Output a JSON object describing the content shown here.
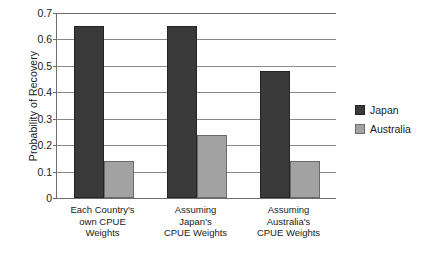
{
  "chart_data": {
    "type": "bar",
    "title": "",
    "subtitle": "",
    "xlabel": "",
    "ylabel": "Probability of Recovery",
    "ylim": [
      0,
      0.7
    ],
    "yticks": [
      "0",
      "0.1",
      "0.2",
      "0.3",
      "0.4",
      "0.5",
      "0.6",
      "0.7"
    ],
    "ytick_values": [
      0,
      0.1,
      0.2,
      0.3,
      0.4,
      0.5,
      0.6,
      0.7
    ],
    "grid": true,
    "grid_axis": "y",
    "legend_position": "right",
    "categories": [
      "Each Country's\nown CPUE\nWeights",
      "Assuming\nJapan's\nCPUE Weights",
      "Assuming\nAustralia's\nCPUE Weights"
    ],
    "series": [
      {
        "name": "Japan",
        "color": "#3a3a3a",
        "values": [
          0.65,
          0.65,
          0.48
        ]
      },
      {
        "name": "Australia",
        "color": "#a2a2a2",
        "values": [
          0.14,
          0.24,
          0.14
        ]
      }
    ]
  },
  "legend": {
    "items": [
      {
        "label": "Japan",
        "swatch": "#3a3a3a"
      },
      {
        "label": "Australia",
        "swatch": "#a2a2a2"
      }
    ]
  }
}
